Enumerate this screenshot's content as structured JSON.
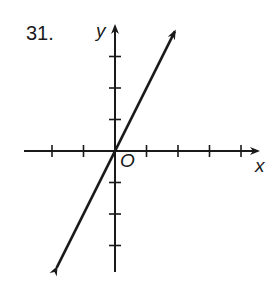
{
  "problem_number": "31.",
  "axes": {
    "x_label": "x",
    "y_label": "y",
    "origin_label": "O"
  },
  "graph": {
    "origin_px": [
      115,
      151
    ],
    "unit_px": 31.5,
    "x_ticks": [
      -2,
      -1,
      1,
      2,
      3,
      4
    ],
    "y_ticks": [
      3,
      2,
      1,
      -1,
      -2,
      -3
    ],
    "line": {
      "equation": "y = 2x",
      "slope": 2,
      "intercept": 0,
      "from": [
        -1.85,
        -3.7
      ],
      "to": [
        1.9,
        3.8
      ],
      "arrows": "both"
    },
    "color": "#1a1a1a"
  }
}
